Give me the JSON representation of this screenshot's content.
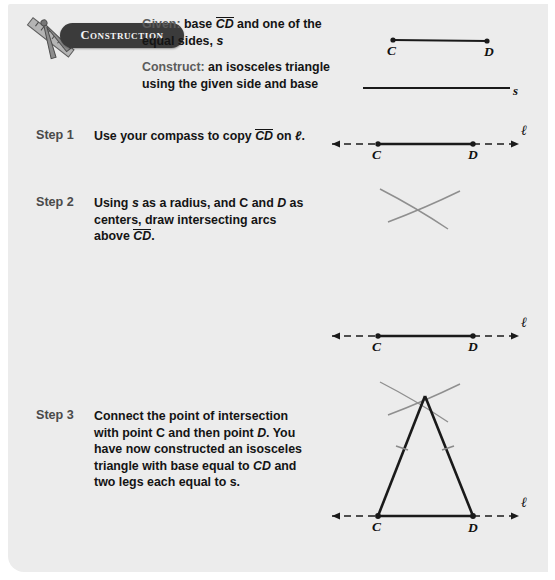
{
  "badge": {
    "label": "Construction",
    "icon": "compass-ruler-icon"
  },
  "given": {
    "lead": "Given:",
    "text_before": " base ",
    "segment": "CD",
    "text_after": " and one of the equal sides, ",
    "side_label": "s"
  },
  "construct": {
    "lead": "Construct:",
    "text": " an isosceles triangle using the given side and base"
  },
  "steps": [
    {
      "label": "Step 1",
      "text_1": "Use your compass to copy ",
      "segment": "CD",
      "text_2": " on ",
      "line_label": "ℓ",
      "text_3": "."
    },
    {
      "label": "Step 2",
      "text_1": "Using ",
      "var_s": "s",
      "text_2": " as a radius, and C and ",
      "var_d": "D",
      "text_3": " as centers, draw intersecting arcs above ",
      "segment": "CD",
      "text_4": "."
    },
    {
      "label": "Step 3",
      "text_1": "Connect the point of intersection with point C and then point ",
      "var_d": "D",
      "text_2": ". You have now constructed an isosceles triangle with base equal to ",
      "segment_cd": "CD",
      "text_3": " and two legs each equal to ",
      "var_s": "s",
      "text_4": "."
    }
  ],
  "figures": {
    "given_segment": {
      "point_c": "C",
      "point_d": "D"
    },
    "given_side": {
      "label": "s"
    },
    "step1_line": {
      "point_c": "C",
      "point_d": "D",
      "line_label": "ℓ"
    },
    "step2_line": {
      "point_c": "C",
      "point_d": "D",
      "line_label": "ℓ"
    },
    "step3_triangle": {
      "point_c": "C",
      "point_d": "D",
      "line_label": "ℓ"
    }
  },
  "colors": {
    "panel_bg": "#ececec",
    "badge_bg": "#3b3b3b",
    "badge_text": "#f4f4f4",
    "step_label": "#4a4a4a",
    "body_text": "#141414",
    "lead_text": "#5c5c5c",
    "ink": "#1a1a1a",
    "arc_gray": "#8f8f8f"
  }
}
